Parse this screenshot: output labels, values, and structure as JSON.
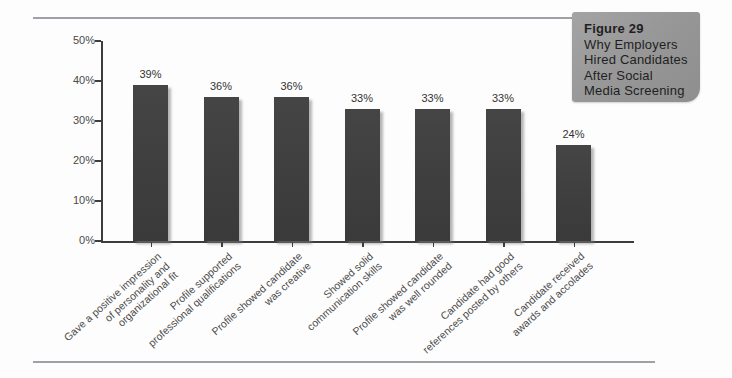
{
  "figure": {
    "lines": [
      "Figure 29",
      "Why Employers",
      "Hired Candidates",
      "After Social",
      "Media Screening"
    ]
  },
  "chart_data": {
    "type": "bar",
    "title": "Why Employers Hired Candidates After Social Media Screening",
    "xlabel": "",
    "ylabel": "",
    "ylim": [
      0,
      50
    ],
    "yticks": [
      "0%",
      "10%",
      "20%",
      "30%",
      "40%",
      "50%"
    ],
    "ytick_values": [
      0,
      10,
      20,
      30,
      40,
      50
    ],
    "grid": false,
    "legend": false,
    "bar_color": "#3f3f3f",
    "categories": [
      [
        "Gave a positive impression",
        "of personality and",
        "organizational fit"
      ],
      [
        "Profile supported",
        "professional qualifications"
      ],
      [
        "Profile showed candidate",
        "was creative"
      ],
      [
        "Showed solid",
        "communication skills"
      ],
      [
        "Profile showed candidate",
        "was well rounded"
      ],
      [
        "Candidate had good",
        "references posted by others"
      ],
      [
        "Candidate received",
        "awards and accolades"
      ]
    ],
    "values": [
      39,
      36,
      36,
      33,
      33,
      33,
      24
    ],
    "value_labels": [
      "39%",
      "36%",
      "36%",
      "33%",
      "33%",
      "33%",
      "24%"
    ]
  }
}
